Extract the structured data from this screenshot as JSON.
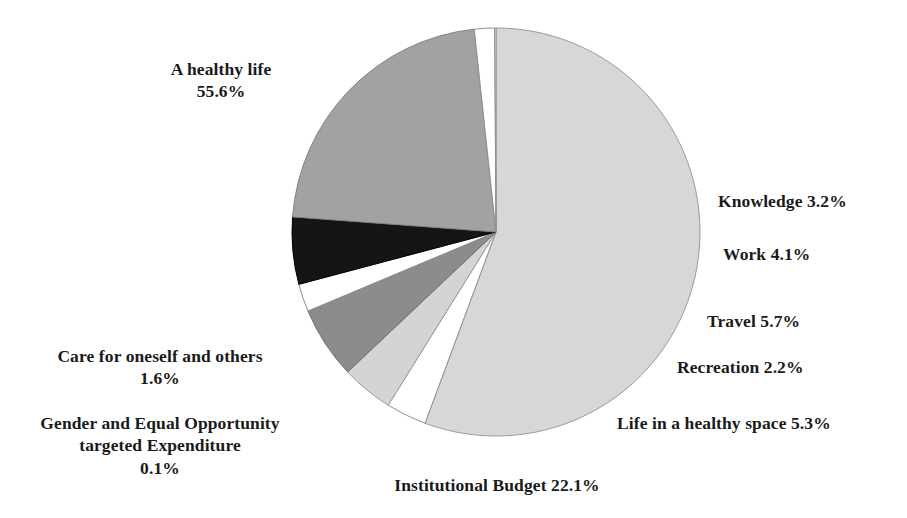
{
  "chart_data": {
    "type": "pie",
    "title": "",
    "subtitle": "",
    "xlabel": "",
    "ylabel": "",
    "legend_position": "none",
    "grid": false,
    "labels_inline": true,
    "unit": "%",
    "categories": [
      "A healthy life",
      "Knowledge",
      "Work",
      "Travel",
      "Recreation",
      "Life in a healthy space",
      "Institutional Budget",
      "Care for oneself and others",
      "Gender and Equal Opportunity targeted Expenditure"
    ],
    "values": [
      55.6,
      3.2,
      4.1,
      5.7,
      2.2,
      5.3,
      22.1,
      1.6,
      0.1
    ],
    "total": 99.9,
    "slices": [
      {
        "name": "A healthy life",
        "value": 55.6,
        "color": "#d7d7d7",
        "stroke": "#9a9a9a"
      },
      {
        "name": "Knowledge",
        "value": 3.2,
        "color": "#ffffff",
        "stroke": "#8f8f8f"
      },
      {
        "name": "Work",
        "value": 4.1,
        "color": "#d4d4d4",
        "stroke": "#9a9a9a"
      },
      {
        "name": "Travel",
        "value": 5.7,
        "color": "#8c8c8c",
        "stroke": "#6f6f6f"
      },
      {
        "name": "Recreation",
        "value": 2.2,
        "color": "#ffffff",
        "stroke": "#8f8f8f"
      },
      {
        "name": "Life in a healthy space",
        "value": 5.3,
        "color": "#151515",
        "stroke": "#000000"
      },
      {
        "name": "Institutional Budget",
        "value": 22.1,
        "color": "#a2a2a2",
        "stroke": "#808080"
      },
      {
        "name": "Care for oneself and others",
        "value": 1.6,
        "color": "#ffffff",
        "stroke": "#8f8f8f"
      },
      {
        "name": "Gender and Equal Opportunity targeted Expenditure",
        "value": 0.1,
        "color": "#ffffff",
        "stroke": "#8f8f8f"
      }
    ],
    "geometry": {
      "cx": 496,
      "cy": 232,
      "r": 204,
      "start_angle_deg": -90,
      "direction": "clockwise"
    }
  },
  "labels": {
    "healthy_life": "A healthy life\n55.6%",
    "care": "Care for oneself and others\n1.6%",
    "gender": "Gender and Equal Opportunity\ntargeted Expenditure\n0.1%",
    "institutional": "Institutional Budget 22.1%",
    "knowledge": "Knowledge 3.2%",
    "work": "Work 4.1%",
    "travel": "Travel 5.7%",
    "recreation": "Recreation 2.2%",
    "life_space": "Life in a healthy space 5.3%"
  },
  "colors": {
    "background": "#ffffff",
    "text": "#1a1a1a",
    "light_gray": "#d7d7d7",
    "medium_gray": "#a2a2a2",
    "dark_gray": "#8c8c8c",
    "black": "#151515",
    "white": "#ffffff"
  }
}
